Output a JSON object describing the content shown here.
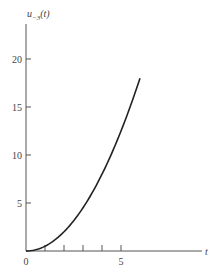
{
  "chart_data": {
    "type": "line",
    "title": "",
    "ylabel": "u_{-3}(t)",
    "ylabel_main": "u",
    "ylabel_sub": "−3",
    "ylabel_arg": "(t)",
    "xlabel": "t",
    "xlim": [
      0,
      9.5
    ],
    "ylim": [
      0,
      22
    ],
    "x_ticks": [
      0,
      1,
      2,
      3,
      4,
      5
    ],
    "x_tick_labels": [
      "0",
      "",
      "",
      "",
      "",
      "5"
    ],
    "y_ticks": [
      5,
      10,
      15,
      20
    ],
    "y_tick_labels": [
      "5",
      "10",
      "15",
      "20"
    ],
    "grid": false,
    "legend": null,
    "series": [
      {
        "name": "u_{-3}(t) = t^2/2",
        "x": [
          0,
          0.5,
          1,
          1.5,
          2,
          2.5,
          3,
          3.5,
          4,
          4.5,
          5,
          5.5,
          6
        ],
        "y": [
          0,
          0.125,
          0.5,
          1.125,
          2,
          3.125,
          4.5,
          6.125,
          8,
          10.125,
          12.5,
          15.125,
          18
        ]
      }
    ]
  }
}
